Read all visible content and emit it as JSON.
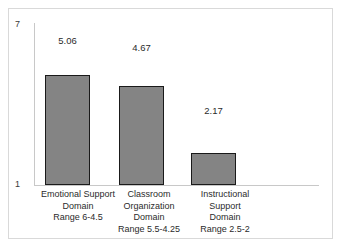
{
  "chart_data": {
    "type": "bar",
    "title": "",
    "xlabel": "",
    "ylabel": "",
    "ylim": [
      1,
      7
    ],
    "grid": false,
    "legend": null,
    "categories": [
      "Emotional Support Domain Range 6-4.5",
      "Classroom Organization Domain Range 5.5-4.25",
      "Instructional Support Domain Range 2.5-2"
    ],
    "values": [
      5.06,
      4.67,
      2.17
    ],
    "value_labels": [
      "5.06",
      "4.67",
      "2.17"
    ],
    "y_tick_labels": [
      "7",
      "1"
    ],
    "bar_color": "#848484",
    "bar_edge_color": "#1a1a1a",
    "axis_color": "#c8c8c8"
  },
  "axis": {
    "y_top_label": "7",
    "y_bottom_label": "1"
  },
  "bars": [
    {
      "value_label": "5.06",
      "label_lines": [
        "Emotional Support",
        "Domain",
        "Range 6-4.5"
      ]
    },
    {
      "value_label": "4.67",
      "label_lines": [
        "Classroom",
        "Organization",
        "Domain",
        "Range 5.5-4.25"
      ]
    },
    {
      "value_label": "2.17",
      "label_lines": [
        "Instructional",
        "Support",
        "Domain",
        "Range 2.5-2"
      ]
    }
  ]
}
